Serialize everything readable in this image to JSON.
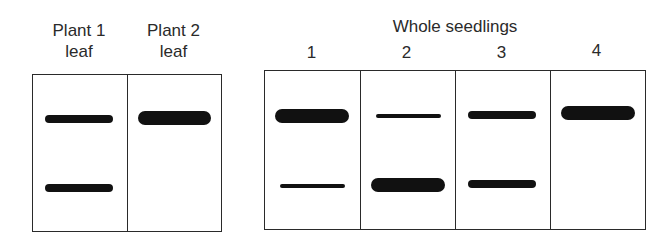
{
  "left_gel": {
    "lanes": [
      {
        "label_line1": "Plant 1",
        "label_line2": "leaf",
        "bands": [
          {
            "y": 118,
            "thickness": "medium"
          },
          {
            "y": 187,
            "thickness": "medium"
          }
        ]
      },
      {
        "label_line1": "Plant 2",
        "label_line2": "leaf",
        "bands": [
          {
            "y": 117,
            "thickness": "thick"
          }
        ]
      }
    ]
  },
  "right_gel": {
    "title": "Whole seedlings",
    "lanes": [
      {
        "label": "1",
        "bands": [
          {
            "y": 115,
            "thickness": "thick"
          },
          {
            "y": 185,
            "thickness": "thin"
          }
        ]
      },
      {
        "label": "2",
        "bands": [
          {
            "y": 114,
            "thickness": "thin"
          },
          {
            "y": 184,
            "thickness": "thick"
          }
        ]
      },
      {
        "label": "3",
        "bands": [
          {
            "y": 114,
            "thickness": "medium"
          },
          {
            "y": 183,
            "thickness": "medium"
          }
        ]
      },
      {
        "label": "4",
        "bands": [
          {
            "y": 111,
            "thickness": "thick"
          }
        ]
      }
    ]
  },
  "colors": {
    "band": "#111111",
    "border": "#2a2a2a",
    "text": "#2a2a2a"
  }
}
